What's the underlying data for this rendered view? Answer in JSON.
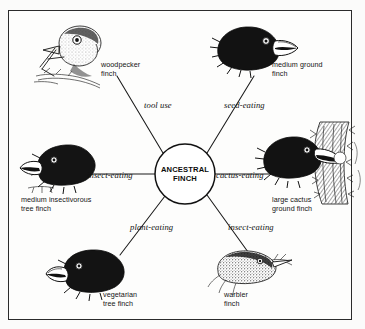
{
  "figure": {
    "border_color": "#2b2b2b",
    "background_color": "#fdfdfc",
    "ink_color": "#111111"
  },
  "hub": {
    "label": "ANCESTRAL\nFINCH",
    "center_x": 185,
    "center_y": 174,
    "radius": 30
  },
  "branches": [
    {
      "id": "tool-use",
      "edge_label": "tool use",
      "edge_label_x": 144,
      "edge_label_y": 100,
      "species": "woodpecker\nfinch",
      "species_label_x": 101,
      "species_label_y": 61,
      "bird": "woodpecker-finch-illustration",
      "line": {
        "x1": 163,
        "y1": 153,
        "x2": 117,
        "y2": 76
      }
    },
    {
      "id": "seed-eating",
      "edge_label": "seed-eating",
      "edge_label_x": 224,
      "edge_label_y": 100,
      "species": "medium ground\nfinch",
      "species_label_x": 272,
      "species_label_y": 61,
      "bird": "medium-ground-finch-illustration",
      "line": {
        "x1": 207,
        "y1": 153,
        "x2": 254,
        "y2": 76
      }
    },
    {
      "id": "cactus-eating",
      "edge_label": "cactus-eating",
      "edge_label_x": 216,
      "edge_label_y": 170,
      "species": "large cactus\nground finch",
      "species_label_x": 272,
      "species_label_y": 196,
      "bird": "large-cactus-ground-finch-illustration",
      "line": {
        "x1": 215,
        "y1": 174,
        "x2": 285,
        "y2": 174
      }
    },
    {
      "id": "insect-eating-right",
      "edge_label": "insect-eating",
      "edge_label_x": 228,
      "edge_label_y": 222,
      "species": "warbler\nfinch",
      "species_label_x": 224,
      "species_label_y": 291,
      "bird": "warbler-finch-illustration",
      "line": {
        "x1": 207,
        "y1": 195,
        "x2": 248,
        "y2": 252
      }
    },
    {
      "id": "plant-eating",
      "edge_label": "plant-eating",
      "edge_label_x": 130,
      "edge_label_y": 222,
      "species": "vegetarian\ntree finch",
      "species_label_x": 103,
      "species_label_y": 291,
      "bird": "vegetarian-tree-finch-illustration",
      "line": {
        "x1": 165,
        "y1": 196,
        "x2": 120,
        "y2": 255
      }
    },
    {
      "id": "insect-eating-left",
      "edge_label": "insect-eating",
      "edge_label_x": 87,
      "edge_label_y": 170,
      "species": "medium insectivorous\ntree finch",
      "species_label_x": 21,
      "species_label_y": 196,
      "bird": "medium-insectivorous-tree-finch-illustration",
      "line": {
        "x1": 155,
        "y1": 174,
        "x2": 85,
        "y2": 174
      }
    }
  ]
}
